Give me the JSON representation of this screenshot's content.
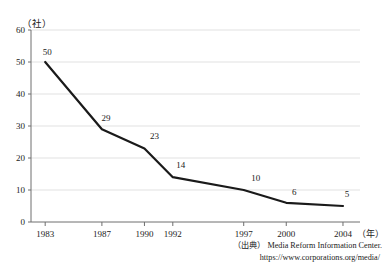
{
  "chart_data": {
    "type": "line",
    "title": "",
    "xlabel": "年",
    "ylabel": "社",
    "unit_label": "（社）",
    "x_unit_label": "（年）",
    "categories": [
      "1983",
      "1987",
      "1990",
      "1992",
      "1997",
      "2000",
      "2004"
    ],
    "values": [
      50,
      29,
      23,
      14,
      10,
      6,
      5
    ],
    "point_labels": [
      "50",
      "29",
      "23",
      "14",
      "10",
      "6",
      "5"
    ],
    "ylim": [
      0,
      60
    ],
    "yticks": [
      "0",
      "10",
      "20",
      "30",
      "40",
      "50",
      "60"
    ],
    "ytick_values": [
      0,
      10,
      20,
      30,
      40,
      50,
      60
    ],
    "grid": true,
    "grid_color": "#d9d9d9",
    "line_color": "#1a1a1a",
    "axis_color": "#6e6e6e",
    "legend": "none"
  },
  "source": {
    "prefix": "（出典）",
    "name": "Media Reform Information Center.",
    "url": "https://www.corporations.org/media/"
  }
}
